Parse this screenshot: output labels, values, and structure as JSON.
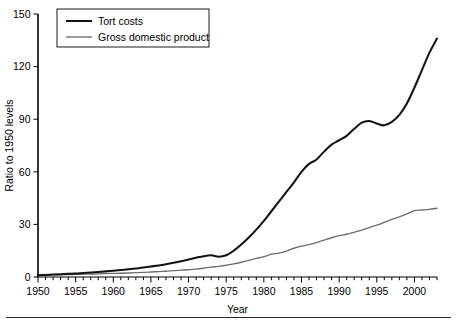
{
  "chart_data": {
    "type": "line",
    "title": "",
    "xlabel": "Year",
    "ylabel": "Ratio to 1950 levels",
    "xlim": [
      1950,
      2003
    ],
    "ylim": [
      0,
      150
    ],
    "yticks": [
      0,
      30,
      60,
      90,
      120,
      150
    ],
    "xticks_labeled": [
      1950,
      1955,
      1960,
      1965,
      1970,
      1975,
      1980,
      1985,
      1990,
      1995,
      2000
    ],
    "xtick_interval_minor": 1,
    "grid": false,
    "legend_position": "upper-left",
    "x": [
      1950,
      1951,
      1952,
      1953,
      1954,
      1955,
      1956,
      1957,
      1958,
      1959,
      1960,
      1961,
      1962,
      1963,
      1964,
      1965,
      1966,
      1967,
      1968,
      1969,
      1970,
      1971,
      1972,
      1973,
      1974,
      1975,
      1976,
      1977,
      1978,
      1979,
      1980,
      1981,
      1982,
      1983,
      1984,
      1985,
      1986,
      1987,
      1988,
      1989,
      1990,
      1991,
      1992,
      1993,
      1994,
      1995,
      1996,
      1997,
      1998,
      1999,
      2000,
      2001,
      2002,
      2003
    ],
    "series": [
      {
        "name": "Tort costs",
        "color": "#121212",
        "width": 2.05,
        "values": [
          1.0,
          1.2,
          1.4,
          1.6,
          1.8,
          2.0,
          2.3,
          2.6,
          2.9,
          3.2,
          3.6,
          4.0,
          4.4,
          4.9,
          5.4,
          6.0,
          6.6,
          7.3,
          8.1,
          9.0,
          10.0,
          11.0,
          11.9,
          12.4,
          11.6,
          12.4,
          15.0,
          18.5,
          22.5,
          27.0,
          32.0,
          37.5,
          43.0,
          48.5,
          54.0,
          60.0,
          64.5,
          67.0,
          71.5,
          75.5,
          78.0,
          80.5,
          84.5,
          88.0,
          89.0,
          87.5,
          86.5,
          88.5,
          92.5,
          99.0,
          108.0,
          118.0,
          128.0,
          136.0
        ]
      },
      {
        "name": "Gross domestic product",
        "color": "#6d6d6d",
        "width": 1.35,
        "values": [
          1.0,
          1.1,
          1.2,
          1.3,
          1.35,
          1.5,
          1.6,
          1.7,
          1.8,
          1.95,
          2.05,
          2.15,
          2.3,
          2.45,
          2.6,
          2.85,
          3.1,
          3.3,
          3.6,
          3.9,
          4.15,
          4.5,
          5.0,
          5.6,
          6.1,
          6.7,
          7.5,
          8.4,
          9.5,
          10.6,
          11.6,
          13.0,
          13.6,
          14.8,
          16.4,
          17.6,
          18.5,
          19.6,
          21.0,
          22.4,
          23.6,
          24.4,
          25.5,
          26.7,
          28.2,
          29.6,
          31.2,
          32.9,
          34.3,
          36.0,
          37.8,
          38.2,
          38.6,
          39.2
        ]
      }
    ]
  },
  "legend": {
    "items": [
      {
        "label": "Tort costs"
      },
      {
        "label": "Gross domestic product"
      }
    ]
  },
  "axes": {
    "y_title": "Ratio to 1950 levels",
    "x_title": "Year",
    "y_tick_labels": [
      "0",
      "30",
      "60",
      "90",
      "120",
      "150"
    ],
    "x_tick_labels": [
      "1950",
      "1955",
      "1960",
      "1965",
      "1970",
      "1975",
      "1980",
      "1985",
      "1990",
      "1995",
      "2000"
    ]
  }
}
